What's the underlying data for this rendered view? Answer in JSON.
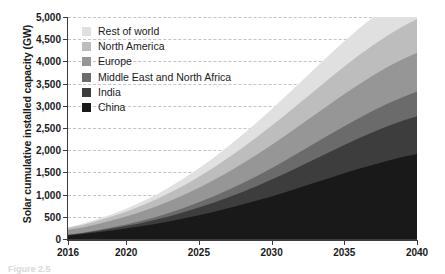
{
  "chart_data": {
    "type": "area",
    "title": "",
    "subtitle": "",
    "xlabel": "",
    "ylabel": "Solar cumulative installed capacity (GW)",
    "stacked": true,
    "grid": true,
    "legend_position": "inside-top-left",
    "xlim": [
      2016,
      2040
    ],
    "ylim": [
      0,
      5000
    ],
    "x": [
      2016,
      2017,
      2018,
      2019,
      2020,
      2021,
      2022,
      2023,
      2024,
      2025,
      2026,
      2027,
      2028,
      2029,
      2030,
      2031,
      2032,
      2033,
      2034,
      2035,
      2036,
      2037,
      2038,
      2039,
      2040
    ],
    "xticks": [
      2016,
      2020,
      2025,
      2030,
      2035,
      2040
    ],
    "xtick_labels": [
      "2016",
      "2020",
      "2025",
      "2030",
      "2035",
      "2040"
    ],
    "yticks": [
      0,
      500,
      1000,
      1500,
      2000,
      2500,
      3000,
      3500,
      4000,
      4500,
      5000
    ],
    "ytick_labels": [
      "0",
      "500",
      "1,000",
      "1,500",
      "2,000",
      "2,500",
      "3,000",
      "3,500",
      "4,000",
      "4,500",
      "5,000"
    ],
    "series": [
      {
        "name": "China",
        "color": "#191919",
        "stack_order": 1,
        "values": [
          78,
          110,
          150,
          192,
          235,
          285,
          340,
          400,
          465,
          535,
          610,
          690,
          775,
          865,
          960,
          1060,
          1165,
          1270,
          1375,
          1480,
          1580,
          1675,
          1765,
          1845,
          1915
        ]
      },
      {
        "name": "India",
        "color": "#3d3d3d",
        "stack_order": 2,
        "values": [
          12,
          20,
          30,
          42,
          56,
          72,
          92,
          115,
          142,
          172,
          206,
          244,
          286,
          330,
          378,
          428,
          480,
          533,
          586,
          638,
          688,
          735,
          778,
          816,
          850
        ]
      },
      {
        "name": "Middle East and North Africa",
        "color": "#6b6b6b",
        "stack_order": 3,
        "values": [
          6,
          10,
          16,
          24,
          34,
          46,
          60,
          77,
          96,
          118,
          142,
          168,
          196,
          226,
          257,
          290,
          323,
          357,
          390,
          423,
          454,
          483,
          510,
          534,
          555
        ]
      },
      {
        "name": "Europe",
        "color": "#969696",
        "stack_order": 4,
        "values": [
          105,
          120,
          138,
          158,
          180,
          205,
          232,
          262,
          294,
          328,
          364,
          402,
          441,
          481,
          522,
          563,
          604,
          645,
          685,
          724,
          760,
          794,
          824,
          851,
          875
        ]
      },
      {
        "name": "North America",
        "color": "#bdbdbd",
        "stack_order": 5,
        "values": [
          45,
          58,
          73,
          90,
          110,
          133,
          158,
          186,
          216,
          248,
          282,
          318,
          355,
          393,
          432,
          471,
          510,
          548,
          585,
          621,
          654,
          685,
          713,
          738,
          760
        ]
      },
      {
        "name": "Rest of world",
        "color": "#e0e0e0",
        "stack_order": 6,
        "values": [
          18,
          26,
          36,
          49,
          65,
          84,
          106,
          131,
          159,
          190,
          223,
          259,
          296,
          335,
          375,
          415,
          455,
          494,
          532,
          568,
          601,
          631,
          657,
          679,
          697
        ]
      }
    ],
    "totals": [
      264,
      344,
      443,
      555,
      680,
      825,
      988,
      1171,
      1372,
      1591,
      1827,
      2081,
      2349,
      2630,
      2924,
      3227,
      3537,
      3847,
      4153,
      4454,
      4737,
      5003,
      5247,
      5463,
      5652
    ],
    "legend_entries": [
      {
        "label": "Rest of world",
        "color": "#e0e0e0"
      },
      {
        "label": "North America",
        "color": "#bdbdbd"
      },
      {
        "label": "Europe",
        "color": "#969696"
      },
      {
        "label": "Middle East and North Africa",
        "color": "#6b6b6b"
      },
      {
        "label": "India",
        "color": "#3d3d3d"
      },
      {
        "label": "China",
        "color": "#191919"
      }
    ]
  },
  "axis": {
    "y_title": "Solar cumulative installed capacity (GW)"
  },
  "caption": {
    "text": "Figure 2.5"
  }
}
